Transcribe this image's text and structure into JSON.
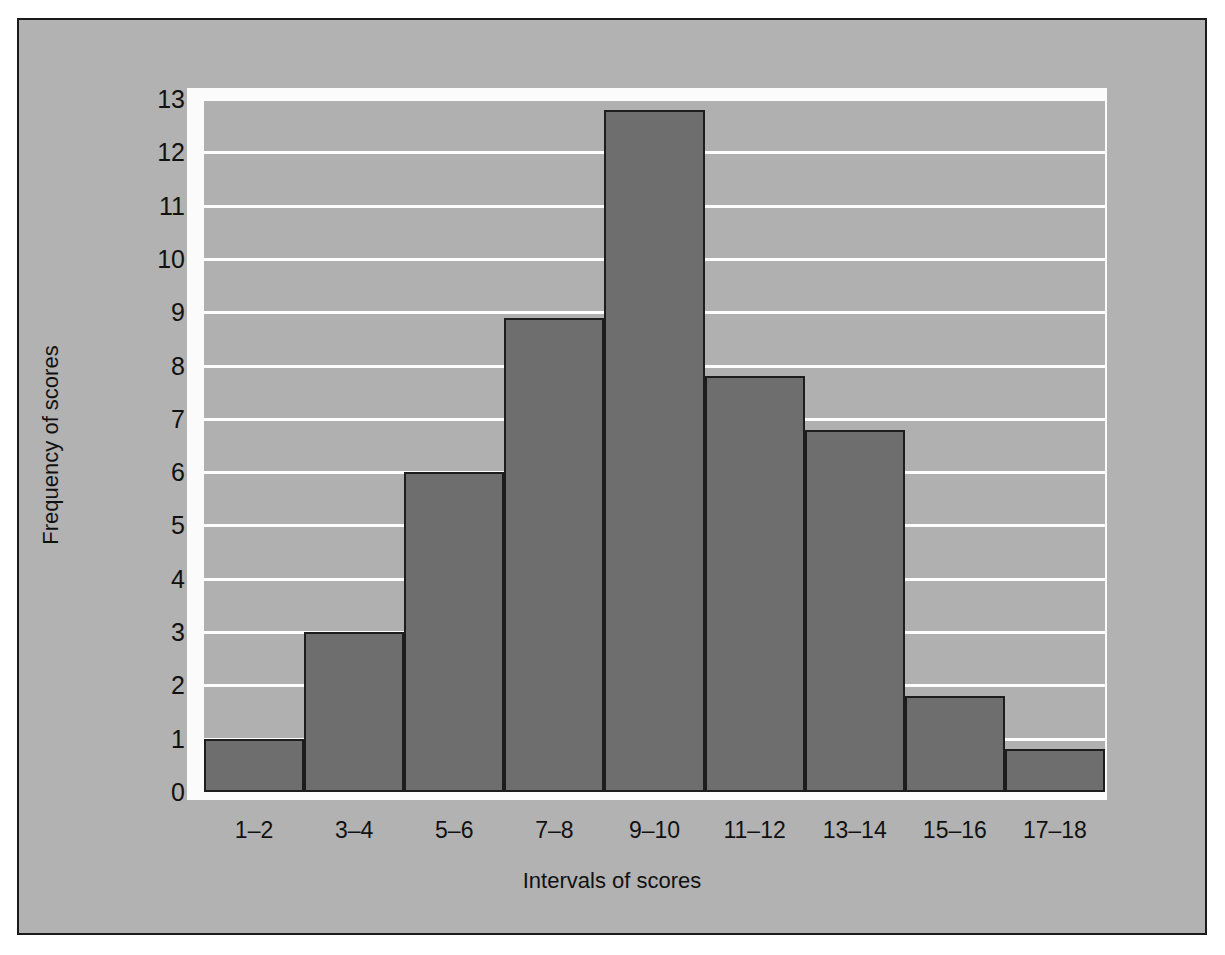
{
  "chart_data": {
    "type": "bar",
    "title": "",
    "subtitle": "",
    "xlabel": "Intervals of scores",
    "ylabel": "Frequency of scores",
    "categories": [
      "1–2",
      "3–4",
      "5–6",
      "7–8",
      "9–10",
      "11–12",
      "13–14",
      "15–16",
      "17–18"
    ],
    "values": [
      1,
      3,
      6,
      8.9,
      12.8,
      7.8,
      6.8,
      1.8,
      0.8
    ],
    "ylim": [
      0,
      13
    ],
    "ytick_labels": [
      "0",
      "1",
      "2",
      "3",
      "4",
      "5",
      "6",
      "7",
      "8",
      "9",
      "10",
      "11",
      "12",
      "13"
    ],
    "ytick_values": [
      0,
      1,
      2,
      3,
      4,
      5,
      6,
      7,
      8,
      9,
      10,
      11,
      12,
      13
    ],
    "grid": "horizontal",
    "legend": "none",
    "bar_gap": 0,
    "colors": {
      "bar_fill": "#6e6e6e",
      "bar_edge": "#1d1d1d",
      "plot_background": "#b0b0b0",
      "figure_background": "#b2b2b2",
      "gridline": "#fdfdfd",
      "mat": "#fbfbfb",
      "frame_border": "#1a1a1a",
      "text": "#111111"
    }
  }
}
